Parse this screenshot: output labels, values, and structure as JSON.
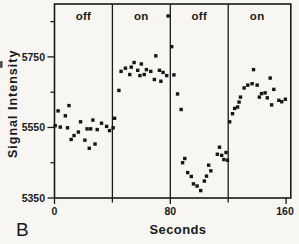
{
  "figure": {
    "panel_label": "B",
    "paper_color": "#f7f6f3",
    "ink_color": "#1a1a1a",
    "marker_color": "#161616"
  },
  "chart_data": {
    "type": "scatter",
    "title": "",
    "xlabel": "Seconds",
    "ylabel": "Signal Intensity",
    "marker": "filled-square",
    "grid": false,
    "legend": "none",
    "xlim": [
      0,
      160
    ],
    "ylim": [
      5350,
      5900
    ],
    "x_ticks": [
      {
        "value": 0,
        "label": "0",
        "major": true
      },
      {
        "value": 40,
        "label": "",
        "major": false
      },
      {
        "value": 80,
        "label": "80",
        "major": true
      },
      {
        "value": 120,
        "label": "",
        "major": false
      },
      {
        "value": 160,
        "label": "160",
        "major": true
      }
    ],
    "y_ticks": [
      {
        "value": 5350,
        "label": "5350",
        "major": true
      },
      {
        "value": 5450,
        "label": "",
        "major": false
      },
      {
        "value": 5550,
        "label": "5550",
        "major": true
      },
      {
        "value": 5650,
        "label": "",
        "major": false
      },
      {
        "value": 5750,
        "label": "5750",
        "major": true
      },
      {
        "value": 5850,
        "label": "",
        "major": false
      }
    ],
    "block_dividers_x": [
      40,
      80,
      120
    ],
    "blocks": [
      {
        "label": "off",
        "range": [
          0,
          40
        ]
      },
      {
        "label": "on",
        "range": [
          40,
          80
        ]
      },
      {
        "label": "off",
        "range": [
          80,
          120
        ]
      },
      {
        "label": "on",
        "range": [
          120,
          160
        ]
      }
    ],
    "series": [
      {
        "name": "signal-intensity",
        "points": [
          [
            0.5,
            5555
          ],
          [
            2.5,
            5597
          ],
          [
            4,
            5551
          ],
          [
            7.5,
            5583
          ],
          [
            9,
            5549
          ],
          [
            10,
            5612
          ],
          [
            11.5,
            5516
          ],
          [
            13.5,
            5527
          ],
          [
            16.5,
            5537
          ],
          [
            18,
            5566
          ],
          [
            21,
            5514
          ],
          [
            22.5,
            5546
          ],
          [
            24,
            5491
          ],
          [
            25,
            5546
          ],
          [
            26.5,
            5571
          ],
          [
            28,
            5503
          ],
          [
            29.5,
            5544
          ],
          [
            32.5,
            5562
          ],
          [
            36,
            5553
          ],
          [
            38,
            5541
          ],
          [
            40.5,
            5549
          ],
          [
            41.5,
            5576
          ],
          [
            44.5,
            5655
          ],
          [
            46,
            5709
          ],
          [
            49,
            5718
          ],
          [
            52,
            5700
          ],
          [
            53,
            5721
          ],
          [
            55,
            5734
          ],
          [
            57.5,
            5712
          ],
          [
            59,
            5697
          ],
          [
            60,
            5730
          ],
          [
            62,
            5700
          ],
          [
            63.5,
            5714
          ],
          [
            66.5,
            5709
          ],
          [
            69,
            5686
          ],
          [
            70,
            5753
          ],
          [
            72.5,
            5712
          ],
          [
            73.5,
            5681
          ],
          [
            75,
            5706
          ],
          [
            77.5,
            5697
          ],
          [
            78.5,
            5866
          ],
          [
            81,
            5779
          ],
          [
            82.5,
            5699
          ],
          [
            85,
            5645
          ],
          [
            87.5,
            5601
          ],
          [
            88.5,
            5450
          ],
          [
            90,
            5462
          ],
          [
            92,
            5422
          ],
          [
            94.5,
            5411
          ],
          [
            96,
            5390
          ],
          [
            98.5,
            5384
          ],
          [
            101,
            5371
          ],
          [
            103.5,
            5398
          ],
          [
            105,
            5412
          ],
          [
            106.5,
            5443
          ],
          [
            108,
            5427
          ],
          [
            112.5,
            5474
          ],
          [
            114,
            5494
          ],
          [
            115.5,
            5471
          ],
          [
            117,
            5459
          ],
          [
            118.5,
            5479
          ],
          [
            119.5,
            5457
          ],
          [
            121,
            5566
          ],
          [
            123,
            5589
          ],
          [
            124.5,
            5604
          ],
          [
            126.5,
            5608
          ],
          [
            127.5,
            5622
          ],
          [
            128.5,
            5636
          ],
          [
            131,
            5662
          ],
          [
            133.5,
            5670
          ],
          [
            136.5,
            5674
          ],
          [
            137.5,
            5714
          ],
          [
            140,
            5670
          ],
          [
            141.5,
            5636
          ],
          [
            143,
            5646
          ],
          [
            145.5,
            5648
          ],
          [
            147,
            5634
          ],
          [
            149,
            5690
          ],
          [
            150,
            5614
          ],
          [
            151.5,
            5658
          ],
          [
            155,
            5627
          ],
          [
            157,
            5623
          ],
          [
            159.5,
            5630
          ]
        ]
      }
    ]
  }
}
